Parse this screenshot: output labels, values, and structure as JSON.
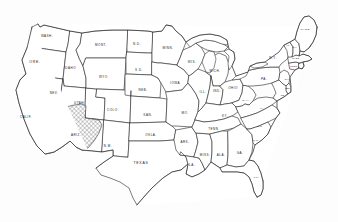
{
  "document": {
    "title": "Map of the Contiguous United States",
    "type": "outline-map",
    "background_color": "#fdfdfd",
    "line_color": "#2b2b2b",
    "label_color": "#1a1a1a"
  },
  "map": {
    "projection_note": "contiguous 48 states outline with state boundary lines",
    "hatched_region": {
      "name": "desert-southwest-hatched-area",
      "description": "cross-hatched shaded region covering southeastern California, southern tip of Nevada and western Arizona",
      "pattern": "diagonal cross-hatch",
      "pattern_color": "#555555",
      "covered_states": [
        "CALIF.",
        "NEV.",
        "ARIZ."
      ]
    },
    "states": [
      {
        "id": "WA",
        "label": "WASH.",
        "size": "sm",
        "x": 47,
        "y": 36
      },
      {
        "id": "OR",
        "label": "ORE.",
        "size": "md",
        "x": 35,
        "y": 62
      },
      {
        "id": "CA",
        "label": "CALIF.",
        "size": "sm",
        "x": 26,
        "y": 117
      },
      {
        "id": "ID",
        "label": "IDAHO",
        "size": "sm",
        "x": 70,
        "y": 68
      },
      {
        "id": "NV",
        "label": "NEV.",
        "size": "sm",
        "x": 54,
        "y": 93
      },
      {
        "id": "UT",
        "label": "UTAH",
        "size": "sm",
        "x": 79,
        "y": 103
      },
      {
        "id": "AZ",
        "label": "ARIZ.",
        "size": "sm",
        "x": 76,
        "y": 135
      },
      {
        "id": "MT",
        "label": "MONT.",
        "size": "sm",
        "x": 101,
        "y": 45
      },
      {
        "id": "WY",
        "label": "WYO.",
        "size": "sm",
        "x": 104,
        "y": 77
      },
      {
        "id": "CO",
        "label": "COLO.",
        "size": "sm",
        "x": 113,
        "y": 110
      },
      {
        "id": "NM",
        "label": "N.M.",
        "size": "sm",
        "x": 108,
        "y": 146
      },
      {
        "id": "ND",
        "label": "N.D.",
        "size": "sm",
        "x": 137,
        "y": 44
      },
      {
        "id": "SD",
        "label": "S.D.",
        "size": "sm",
        "x": 139,
        "y": 70
      },
      {
        "id": "NE",
        "label": "NEB.",
        "size": "sm",
        "x": 143,
        "y": 90
      },
      {
        "id": "KS",
        "label": "KAN.",
        "size": "sm",
        "x": 148,
        "y": 115
      },
      {
        "id": "OK",
        "label": "OKLA.",
        "size": "sm",
        "x": 151,
        "y": 135
      },
      {
        "id": "TX",
        "label": "TEXAS",
        "size": "md",
        "x": 141,
        "y": 163
      },
      {
        "id": "MN",
        "label": "MINN.",
        "size": "sm",
        "x": 168,
        "y": 48
      },
      {
        "id": "IA",
        "label": "IOWA",
        "size": "sm",
        "x": 175,
        "y": 83
      },
      {
        "id": "MO",
        "label": "MO.",
        "size": "sm",
        "x": 185,
        "y": 113
      },
      {
        "id": "AR",
        "label": "ARK.",
        "size": "sm",
        "x": 185,
        "y": 142
      },
      {
        "id": "LA",
        "label": "LA.",
        "size": "sm",
        "x": 192,
        "y": 165
      },
      {
        "id": "WI",
        "label": "WIS.",
        "size": "sm",
        "x": 192,
        "y": 62
      },
      {
        "id": "IL",
        "label": "ILL.",
        "size": "sm",
        "x": 203,
        "y": 92
      },
      {
        "id": "MS",
        "label": "MISS.",
        "size": "sm",
        "x": 205,
        "y": 155
      },
      {
        "id": "MI",
        "label": "MICH.",
        "size": "sm",
        "x": 215,
        "y": 71
      },
      {
        "id": "IN",
        "label": "IND.",
        "size": "sm",
        "x": 217,
        "y": 91
      },
      {
        "id": "TN",
        "label": "TENN.",
        "size": "sm",
        "x": 214,
        "y": 129
      },
      {
        "id": "AL",
        "label": "ALA.",
        "size": "sm",
        "x": 221,
        "y": 155
      },
      {
        "id": "KY",
        "label": "KY.",
        "size": "sm",
        "x": 225,
        "y": 116
      },
      {
        "id": "OH",
        "label": "OHIO",
        "size": "sm",
        "x": 233,
        "y": 88
      },
      {
        "id": "GA",
        "label": "GA.",
        "size": "sm",
        "x": 240,
        "y": 153
      },
      {
        "id": "FL",
        "label": "FLA.",
        "size": "xs",
        "x": 257,
        "y": 177
      },
      {
        "id": "WV",
        "label": "W.VA.",
        "size": "xs",
        "x": 246,
        "y": 100
      },
      {
        "id": "SC",
        "label": "S.C.",
        "size": "xs",
        "x": 256,
        "y": 140
      },
      {
        "id": "NC",
        "label": "N.C.",
        "size": "xs",
        "x": 260,
        "y": 126
      },
      {
        "id": "VA",
        "label": "VA.",
        "size": "xs",
        "x": 262,
        "y": 108
      },
      {
        "id": "PA",
        "label": "PA.",
        "size": "sm",
        "x": 264,
        "y": 79
      },
      {
        "id": "NY",
        "label": "N.Y.",
        "size": "sm",
        "x": 273,
        "y": 58
      },
      {
        "id": "MD",
        "label": "MD.",
        "size": "tiny",
        "x": 283,
        "y": 95
      },
      {
        "id": "DEL",
        "label": "DEL.",
        "size": "tiny",
        "x": 288,
        "y": 88
      },
      {
        "id": "NJ",
        "label": "N.J.",
        "size": "tiny",
        "x": 287,
        "y": 79
      },
      {
        "id": "CT",
        "label": "CONN.",
        "size": "tiny",
        "x": 294,
        "y": 66
      },
      {
        "id": "RI",
        "label": "R.I.",
        "size": "tiny",
        "x": 301,
        "y": 63
      },
      {
        "id": "MA",
        "label": "MASS.",
        "size": "tiny",
        "x": 296,
        "y": 58
      },
      {
        "id": "VT",
        "label": "VT.",
        "size": "tiny",
        "x": 288,
        "y": 45
      },
      {
        "id": "NH",
        "label": "N.H.",
        "size": "tiny",
        "x": 295,
        "y": 47
      },
      {
        "id": "ME",
        "label": "MAINE",
        "size": "xs",
        "x": 305,
        "y": 29
      }
    ]
  }
}
